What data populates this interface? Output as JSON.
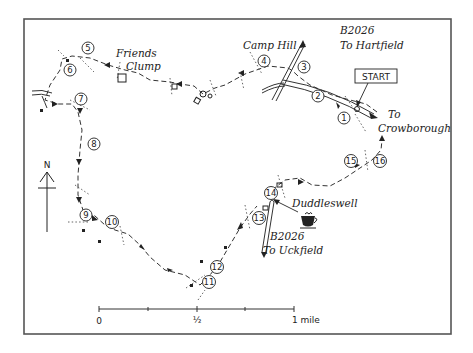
{
  "map": {
    "title_labels": {
      "start": "START",
      "camp_hill": "Camp Hill",
      "friends_clump_1": "Friends",
      "friends_clump_2": "Clump",
      "b2026_north_road": "B2026",
      "b2026_north_dest": "To Hartfield",
      "to_1": "To",
      "crowborough": "Crowborough",
      "duddleswell": "Duddleswell",
      "b2026_south_road": "B2026",
      "b2026_south_dest": "To Uckfield"
    },
    "compass": {
      "label": "N"
    },
    "scale_bar": {
      "tick_labels": [
        "0",
        "½",
        "1 mile"
      ],
      "unit": "mile"
    },
    "waypoints": [
      {
        "n": "1",
        "x": 344,
        "y": 118
      },
      {
        "n": "2",
        "x": 318,
        "y": 96
      },
      {
        "n": "3",
        "x": 304,
        "y": 67
      },
      {
        "n": "4",
        "x": 264,
        "y": 61
      },
      {
        "n": "5",
        "x": 88,
        "y": 48
      },
      {
        "n": "6",
        "x": 70,
        "y": 70
      },
      {
        "n": "7",
        "x": 81,
        "y": 99
      },
      {
        "n": "8",
        "x": 94,
        "y": 144
      },
      {
        "n": "9",
        "x": 86,
        "y": 215
      },
      {
        "n": "10",
        "x": 112,
        "y": 222
      },
      {
        "n": "11",
        "x": 209,
        "y": 282
      },
      {
        "n": "12",
        "x": 217,
        "y": 267
      },
      {
        "n": "13",
        "x": 259,
        "y": 218
      },
      {
        "n": "14",
        "x": 271,
        "y": 193
      },
      {
        "n": "15",
        "x": 351,
        "y": 161
      },
      {
        "n": "16",
        "x": 380,
        "y": 161
      }
    ],
    "icons": [
      "north-arrow",
      "cafe-cup"
    ],
    "colors": {
      "ink": "#222222",
      "frame": "#555555",
      "background": "#ffffff"
    }
  }
}
